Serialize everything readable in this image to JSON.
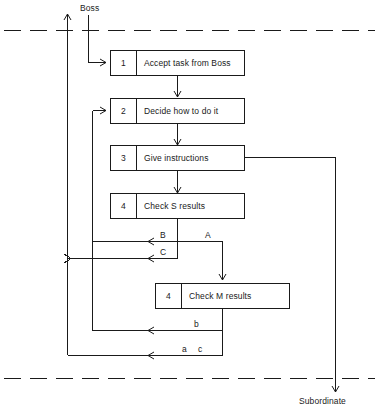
{
  "diagram": {
    "colors": {
      "line": "#1a1a1a",
      "text": "#1a1a1a",
      "background": "#ffffff"
    },
    "boundaries": {
      "top_label": "Boss",
      "bottom_label": "Subordinate"
    },
    "boxes": [
      {
        "num": "1",
        "label": "Accept task from Boss"
      },
      {
        "num": "2",
        "label": "Decide how to do it"
      },
      {
        "num": "3",
        "label": "Give instructions"
      },
      {
        "num": "4",
        "label": "Check S results"
      },
      {
        "num": "4",
        "label": "Check M results"
      }
    ],
    "edge_labels": [
      {
        "id": "branch-b",
        "text": "B"
      },
      {
        "id": "branch-a",
        "text": "A"
      },
      {
        "id": "branch-c",
        "text": "C"
      },
      {
        "id": "branch-lower-b",
        "text": "b"
      },
      {
        "id": "branch-lower-a",
        "text": "a"
      },
      {
        "id": "branch-lower-c",
        "text": "c"
      }
    ]
  }
}
